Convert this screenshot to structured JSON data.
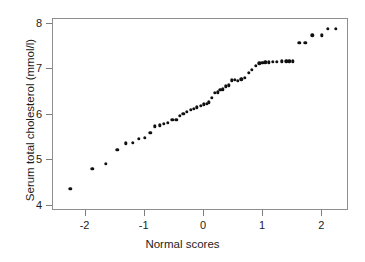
{
  "chart_data": {
    "type": "scatter",
    "title": "",
    "xlabel": "Normal scores",
    "ylabel": "Serum total cholesterol (mmol/l)",
    "xlim": [
      -2.55,
      2.45
    ],
    "ylim": [
      3.88,
      8.1
    ],
    "xticks": [
      -2,
      -1,
      0,
      1,
      2
    ],
    "xticklabels": [
      "-2",
      "-1",
      "0",
      "1",
      "2"
    ],
    "yticks": [
      4,
      5,
      6,
      7,
      8
    ],
    "yticklabels": [
      "4",
      "5",
      "6",
      "7",
      "8"
    ],
    "grid": false,
    "legend": false,
    "marker": "filled-circle",
    "marker_color": "#101010",
    "frame_color": "#8e8e8e",
    "background": "#ffffff",
    "n_points": 56,
    "x": [
      -2.24,
      -1.87,
      -1.64,
      -1.45,
      -1.3,
      -1.18,
      -1.08,
      -0.98,
      -0.89,
      -0.81,
      -0.73,
      -0.66,
      -0.59,
      -0.52,
      -0.45,
      -0.39,
      -0.33,
      -0.27,
      -0.21,
      -0.15,
      -0.1,
      -0.04,
      0.01,
      0.06,
      0.1,
      0.15,
      0.2,
      0.25,
      0.29,
      0.34,
      0.39,
      0.44,
      0.49,
      0.54,
      0.59,
      0.65,
      0.71,
      0.77,
      0.83,
      0.89,
      0.95,
      1.0,
      1.05,
      1.11,
      1.18,
      1.25,
      1.33,
      1.41,
      1.46,
      1.52,
      1.63,
      1.73,
      1.85,
      2.01,
      2.11,
      2.24
    ],
    "y": [
      4.35,
      4.79,
      4.9,
      5.2,
      5.35,
      5.36,
      5.45,
      5.47,
      5.58,
      5.72,
      5.74,
      5.78,
      5.8,
      5.86,
      5.86,
      5.95,
      6.0,
      6.04,
      6.08,
      6.1,
      6.14,
      6.17,
      6.2,
      6.22,
      6.25,
      6.34,
      6.45,
      6.47,
      6.52,
      6.53,
      6.6,
      6.62,
      6.73,
      6.74,
      6.72,
      6.75,
      6.79,
      6.9,
      6.96,
      7.05,
      7.1,
      7.12,
      7.13,
      7.13,
      7.14,
      7.14,
      7.15,
      7.15,
      7.15,
      7.15,
      7.55,
      7.55,
      7.72,
      7.72,
      7.86,
      7.86
    ]
  },
  "axes": {
    "x_title": "Normal scores",
    "y_title": "Serum total cholesterol (mmol/l)"
  }
}
